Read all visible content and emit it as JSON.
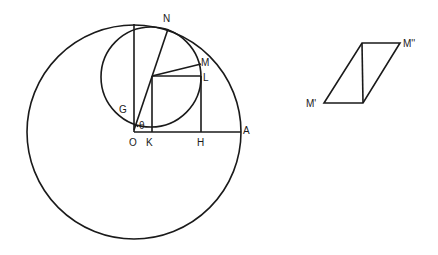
{
  "diagram": {
    "stroke_color": "#1a1a1a",
    "background": "#ffffff",
    "main_figure": {
      "big_circle": {
        "cx": 134,
        "cy": 132,
        "r": 107
      },
      "small_circle": {
        "cx": 151,
        "cy": 77,
        "r": 50
      },
      "labels": {
        "N": "N",
        "M": "M",
        "L": "L",
        "G": "G",
        "theta": "θ",
        "O": "O",
        "K": "K",
        "H": "H",
        "A": "A"
      }
    },
    "parallelogram": {
      "labels": {
        "M_prime": "M'",
        "M_double_prime": "M''"
      }
    }
  }
}
